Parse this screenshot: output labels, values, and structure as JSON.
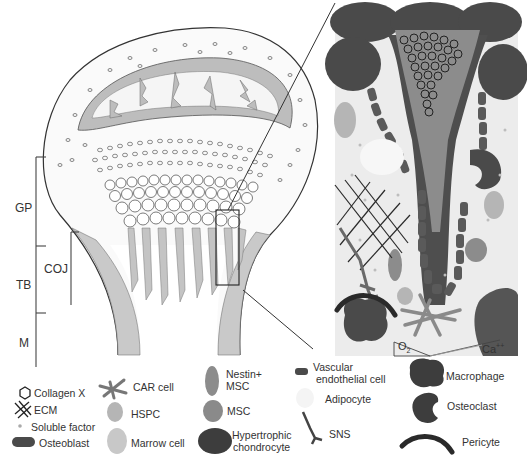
{
  "zones": {
    "gp": "GP",
    "tb": "TB",
    "m": "M",
    "coj": "COJ"
  },
  "inset": {
    "o2_label": "O",
    "o2_sub": "2",
    "ca_label": "Ca",
    "ca_sup": "++"
  },
  "legend": {
    "collagen_x": "Collagen X",
    "ecm": "ECM",
    "soluble_factor": "Soluble factor",
    "osteoblast": "Osteoblast",
    "car_cell": "CAR cell",
    "hspc": "HSPC",
    "marrow_cell": "Marrow cell",
    "nestin_line1": "Nestin+",
    "nestin_line2": "MSC",
    "msc": "MSC",
    "hyper_line1": "Hypertrophic",
    "hyper_line2": "chondrocyte",
    "vascular_line1": "Vascular",
    "vascular_line2": "endothelial cell",
    "adipocyte": "Adipocyte",
    "sns": "SNS",
    "macrophage": "Macrophage",
    "osteoclast": "Osteoclast",
    "pericyte": "Pericyte"
  },
  "colors": {
    "dark_cell": "#4a4a4a",
    "mid_gray": "#8a8a8a",
    "light_gray": "#b5b5b5",
    "pale": "#d8d8d8",
    "inset_bg": "#ececec",
    "line": "#333333"
  }
}
